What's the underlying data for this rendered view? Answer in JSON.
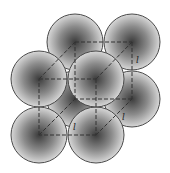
{
  "diagram": {
    "type": "simple-cubic-unit-cell",
    "sphere_radius": 28,
    "sphere_stroke": "#4a4a4a",
    "sphere_fill_center": "#3c3c3c",
    "sphere_fill_edge": "#d8d8d8",
    "edge_color": "#333333",
    "spheres": [
      {
        "id": "back-bottom-left",
        "cx": 75,
        "cy": 99
      },
      {
        "id": "back-top-left",
        "cx": 75,
        "cy": 42
      },
      {
        "id": "back-top-right",
        "cx": 132,
        "cy": 42
      },
      {
        "id": "back-bottom-right",
        "cx": 132,
        "cy": 99
      },
      {
        "id": "front-top-left",
        "cx": 39,
        "cy": 79
      },
      {
        "id": "front-bottom-left",
        "cx": 39,
        "cy": 135
      },
      {
        "id": "front-bottom-right",
        "cx": 96,
        "cy": 135
      },
      {
        "id": "front-top-right",
        "cx": 96,
        "cy": 79
      }
    ],
    "edge_labels": [
      {
        "text": "l",
        "x": 136,
        "y": 63
      },
      {
        "text": "l",
        "x": 122,
        "y": 120
      },
      {
        "text": "l",
        "x": 73,
        "y": 130
      }
    ]
  }
}
